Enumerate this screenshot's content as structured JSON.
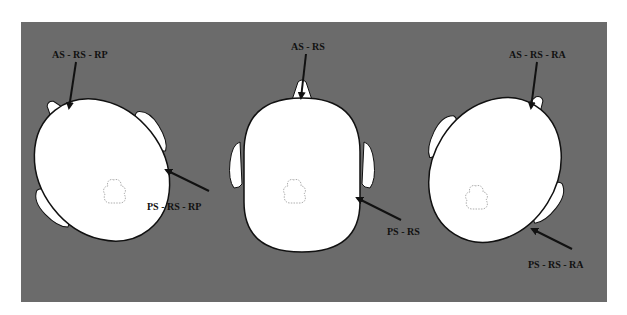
{
  "figure": {
    "background_color": "#6b6b6b",
    "head_color": "#ffffff",
    "outline_color": "#111111",
    "heads": [
      {
        "id": "left",
        "description": "head rotated (posterior rotation)",
        "top_label": "AS - RS - RP",
        "bottom_label": "PS - RS - RP"
      },
      {
        "id": "center",
        "description": "head in neutral position",
        "top_label": "AS - RS",
        "bottom_label": "PS - RS"
      },
      {
        "id": "right",
        "description": "head rotated (anterior rotation)",
        "top_label": "AS - RS - RA",
        "bottom_label": "PS - RS - RA"
      }
    ]
  }
}
